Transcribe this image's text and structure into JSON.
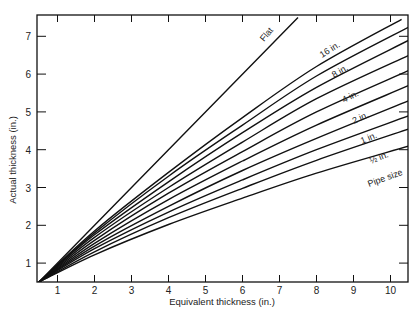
{
  "chart_data": {
    "type": "line",
    "title": "",
    "xlabel": "Equivalent thickness (in.)",
    "ylabel": "Actual thickness (in.)",
    "xlim": [
      0.5,
      10.5
    ],
    "ylim": [
      0.5,
      7.5
    ],
    "xticks": [
      1,
      2,
      3,
      4,
      5,
      6,
      7,
      8,
      9,
      10
    ],
    "yticks": [
      1,
      2,
      3,
      4,
      5,
      6,
      7
    ],
    "grid": false,
    "legend": "inline curve labels",
    "annotations": [
      "Flat",
      "16 in.",
      "8 in.",
      "4 in.",
      "2 in.",
      "1 in.",
      "½ in.",
      "Pipe size"
    ],
    "series": [
      {
        "name": "Flat",
        "x": [
          0.5,
          7.5
        ],
        "y": [
          0.5,
          7.5
        ]
      },
      {
        "name": "16 in.",
        "x": [
          0.5,
          2,
          4,
          6,
          8,
          10.3
        ],
        "y": [
          0.5,
          1.85,
          3.4,
          4.85,
          6.2,
          7.45
        ]
      },
      {
        "name": "12 in.",
        "x": [
          0.5,
          2,
          4,
          6,
          8,
          10.5
        ],
        "y": [
          0.5,
          1.8,
          3.3,
          4.65,
          5.95,
          7.25
        ]
      },
      {
        "name": "8 in.",
        "x": [
          0.5,
          2,
          4,
          6,
          8,
          10.5
        ],
        "y": [
          0.5,
          1.75,
          3.15,
          4.45,
          5.65,
          6.9
        ]
      },
      {
        "name": "6 in.",
        "x": [
          0.5,
          2,
          4,
          6,
          8,
          10.5
        ],
        "y": [
          0.5,
          1.68,
          3.0,
          4.2,
          5.35,
          6.5
        ]
      },
      {
        "name": "4 in.",
        "x": [
          0.5,
          2,
          4,
          6,
          8,
          10.5
        ],
        "y": [
          0.5,
          1.6,
          2.85,
          3.95,
          5.0,
          6.1
        ]
      },
      {
        "name": "3 in.",
        "x": [
          0.5,
          2,
          4,
          6,
          8,
          10.5
        ],
        "y": [
          0.5,
          1.52,
          2.68,
          3.7,
          4.65,
          5.7
        ]
      },
      {
        "name": "2 in.",
        "x": [
          0.5,
          2,
          4,
          6,
          8,
          10.5
        ],
        "y": [
          0.5,
          1.45,
          2.5,
          3.45,
          4.3,
          5.3
        ]
      },
      {
        "name": "1½ in.",
        "x": [
          0.5,
          2,
          4,
          6,
          8,
          10.5
        ],
        "y": [
          0.5,
          1.38,
          2.35,
          3.2,
          4.0,
          4.9
        ]
      },
      {
        "name": "1 in.",
        "x": [
          0.5,
          2,
          4,
          6,
          8,
          10.5
        ],
        "y": [
          0.5,
          1.3,
          2.2,
          2.98,
          3.72,
          4.55
        ]
      },
      {
        "name": "½ in.",
        "x": [
          0.5,
          2,
          4,
          6,
          8,
          10.5
        ],
        "y": [
          0.5,
          1.22,
          2.02,
          2.72,
          3.38,
          4.1
        ]
      }
    ]
  }
}
